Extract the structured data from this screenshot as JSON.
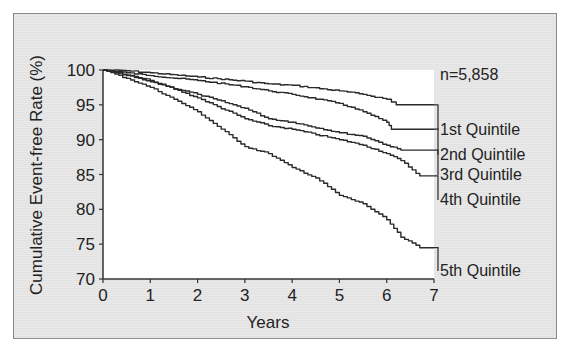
{
  "chart_data": {
    "type": "line",
    "title": "",
    "xlabel": "Years",
    "ylabel": "Cumulative Event-free Rate (%)",
    "xlim": [
      0,
      7
    ],
    "ylim": [
      70,
      100
    ],
    "x_ticks": [
      "0",
      "1",
      "2",
      "3",
      "4",
      "5",
      "6",
      "7"
    ],
    "y_ticks": [
      "70",
      "75",
      "80",
      "85",
      "90",
      "95",
      "100"
    ],
    "grid": false,
    "annotation": "n=5,858",
    "legend_position": "right, labels at curve ends",
    "series": [
      {
        "name": "1st Quintile",
        "x": [
          0,
          0.5,
          1,
          2,
          3,
          3.5,
          4,
          5,
          5.5,
          6,
          6.2,
          7
        ],
        "values": [
          100,
          99.9,
          99.6,
          99.0,
          98.4,
          98.0,
          97.8,
          97.0,
          96.5,
          95.8,
          95.0,
          95.0
        ]
      },
      {
        "name": "2nd Quintile",
        "x": [
          0,
          0.5,
          1,
          2,
          3,
          3.5,
          4,
          5,
          5.5,
          6,
          6.1,
          7
        ],
        "values": [
          100,
          99.6,
          99.2,
          98.5,
          97.6,
          97.0,
          96.5,
          95.2,
          94.0,
          92.5,
          91.5,
          91.5
        ]
      },
      {
        "name": "3rd Quintile",
        "x": [
          0,
          0.5,
          1,
          2,
          3,
          3.5,
          4,
          5,
          5.5,
          6,
          6.3,
          7
        ],
        "values": [
          100,
          99.2,
          98.3,
          96.5,
          94.5,
          93.0,
          92.5,
          91.0,
          90.5,
          89.2,
          88.5,
          88.5
        ]
      },
      {
        "name": "4th Quintile",
        "x": [
          0,
          0.5,
          1,
          2,
          3,
          3.5,
          4,
          5,
          5.5,
          6,
          6.3,
          6.7,
          7
        ],
        "values": [
          100,
          99.3,
          98.5,
          96.0,
          93.0,
          92.0,
          91.5,
          90.0,
          89.2,
          88.0,
          87.0,
          84.8,
          84.8
        ]
      },
      {
        "name": "5th Quintile",
        "x": [
          0,
          0.5,
          1,
          1.5,
          2,
          3,
          3.5,
          4,
          4.5,
          5,
          5.5,
          6,
          6.3,
          6.7,
          7
        ],
        "values": [
          100,
          98.8,
          97.5,
          95.8,
          94.0,
          89.0,
          88.0,
          86.0,
          84.5,
          82.0,
          80.8,
          78.5,
          76.0,
          74.5,
          74.5
        ]
      }
    ],
    "sample_size": "n=5,858"
  },
  "labels": {
    "ylabel": "Cumulative Event-free Rate (%)",
    "xlabel": "Years",
    "n": "n=5,858",
    "legend": [
      "1st Quintile",
      "2nd Quintile",
      "3rd Quintile",
      "4th Quintile",
      "5th Quintile"
    ]
  }
}
